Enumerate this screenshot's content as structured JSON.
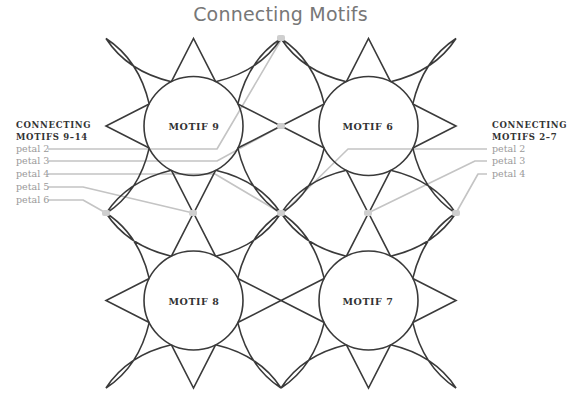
{
  "title": "Connecting Motifs",
  "colors": {
    "outline": "#3a3a3a",
    "leader": "#c4c4c4",
    "title": "#777777",
    "label": "#9a9a9a",
    "heading": "#333333"
  },
  "motifs": [
    {
      "label": "MOTIF 9",
      "cx": 193.5,
      "cy": 126
    },
    {
      "label": "MOTIF 6",
      "cx": 368.5,
      "cy": 126
    },
    {
      "label": "MOTIF 8",
      "cx": 193.5,
      "cy": 300.5
    },
    {
      "label": "MOTIF 7",
      "cx": 368.5,
      "cy": 300.5
    }
  ],
  "left_group": {
    "heading_line1": "CONNECTING",
    "heading_line2": "MOTIFS 9–14",
    "petals": [
      "petal 2",
      "petal 3",
      "petal 4",
      "petal 5",
      "petal 6"
    ]
  },
  "right_group": {
    "heading_line1": "CONNECTING",
    "heading_line2": "MOTIFS 2–7",
    "petals": [
      "petal 2",
      "petal 3",
      "petal 4"
    ]
  }
}
